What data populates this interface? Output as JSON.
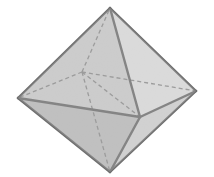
{
  "figure": {
    "kind": "polyhedron-illustration",
    "caption": "",
    "background_color": "#ffffff",
    "canvas": {
      "width": 214,
      "height": 177
    },
    "style": {
      "solid_edge_color": "#6e6e6e",
      "solid_edge_width": 2.4,
      "hidden_edge_color": "#8a8a8a",
      "hidden_edge_width": 1.3,
      "hidden_edge_dash": "4 3",
      "grain_opacity": 0.16
    },
    "vertices": {
      "top": {
        "label": "top apex",
        "x": 110,
        "y": 8,
        "hidden": false
      },
      "left": {
        "label": "left vertex",
        "x": 18,
        "y": 98,
        "hidden": false
      },
      "right": {
        "label": "right vertex",
        "x": 196,
        "y": 91,
        "hidden": false
      },
      "bottom": {
        "label": "bottom apex",
        "x": 110,
        "y": 172,
        "hidden": false
      },
      "front": {
        "label": "front vertex",
        "x": 140,
        "y": 117,
        "hidden": false
      },
      "back": {
        "label": "back vertex",
        "x": 82,
        "y": 72,
        "hidden": true
      }
    },
    "faces": [
      {
        "name": "upper-left-front",
        "points": "110,8 18,98 140,117",
        "fill": "#c3c3c3"
      },
      {
        "name": "upper-right-front",
        "points": "110,8 140,117 196,91",
        "fill": "#d4d4d4"
      },
      {
        "name": "lower-left-front",
        "points": "18,98 110,172 140,117",
        "fill": "#b5b5b5"
      },
      {
        "name": "lower-right-front",
        "points": "140,117 110,172 196,91",
        "fill": "#c9c9c9"
      }
    ],
    "solid_edges": [
      {
        "name": "top-to-left",
        "x1": 110,
        "y1": 8,
        "x2": 18,
        "y2": 98
      },
      {
        "name": "top-to-right",
        "x1": 110,
        "y1": 8,
        "x2": 196,
        "y2": 91
      },
      {
        "name": "top-to-front",
        "x1": 110,
        "y1": 8,
        "x2": 140,
        "y2": 117
      },
      {
        "name": "left-to-bottom",
        "x1": 18,
        "y1": 98,
        "x2": 110,
        "y2": 172
      },
      {
        "name": "right-to-bottom",
        "x1": 196,
        "y1": 91,
        "x2": 110,
        "y2": 172
      },
      {
        "name": "left-to-front",
        "x1": 18,
        "y1": 98,
        "x2": 140,
        "y2": 117
      },
      {
        "name": "front-to-right",
        "x1": 140,
        "y1": 117,
        "x2": 196,
        "y2": 91
      },
      {
        "name": "front-to-bottom",
        "x1": 140,
        "y1": 117,
        "x2": 110,
        "y2": 172
      }
    ],
    "hidden_edges": [
      {
        "name": "back-to-top",
        "x1": 82,
        "y1": 72,
        "x2": 110,
        "y2": 8
      },
      {
        "name": "back-to-left",
        "x1": 82,
        "y1": 72,
        "x2": 18,
        "y2": 98
      },
      {
        "name": "back-to-right",
        "x1": 82,
        "y1": 72,
        "x2": 196,
        "y2": 91
      },
      {
        "name": "back-to-front",
        "x1": 82,
        "y1": 72,
        "x2": 140,
        "y2": 117
      },
      {
        "name": "back-to-bottom",
        "x1": 82,
        "y1": 72,
        "x2": 110,
        "y2": 172
      }
    ]
  }
}
